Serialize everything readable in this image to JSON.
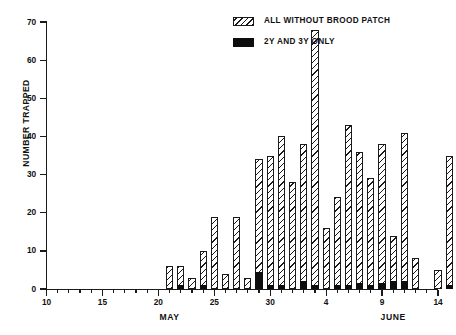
{
  "chart_data": {
    "type": "bar",
    "title": "",
    "subtitle": "",
    "xlabel": "",
    "ylabel": "NUMBER TRAPPED",
    "ylim": [
      0,
      70
    ],
    "ytick_values": [
      0,
      10,
      20,
      30,
      40,
      50,
      60,
      70
    ],
    "ytick_labels": [
      "0",
      "10",
      "20",
      "30",
      "40",
      "50",
      "60",
      "70"
    ],
    "xlim": [
      "May 10",
      "June 14"
    ],
    "xtick_labels": [
      "10",
      "15",
      "20",
      "25",
      "30",
      "4",
      "9",
      "14"
    ],
    "xtick_days": [
      0,
      5,
      10,
      15,
      20,
      25,
      30,
      35
    ],
    "month_labels": [
      "MAY",
      "JUNE"
    ],
    "grid": false,
    "legend_position": "top-right",
    "stacked": true,
    "series": [
      {
        "name": "ALL WITHOUT BROOD PATCH",
        "style": "hatched",
        "values": [
          0,
          6,
          6,
          3,
          10,
          19,
          4,
          19,
          3,
          34,
          35,
          40,
          28,
          38,
          68,
          16,
          24,
          43,
          36,
          29,
          38,
          14,
          41,
          8,
          5,
          35,
          27,
          23,
          2,
          30,
          4,
          2,
          0,
          13,
          15,
          0
        ]
      },
      {
        "name": "2Y AND 3Y ONLY",
        "style": "solid",
        "values": [
          0,
          0,
          1,
          0,
          1,
          0,
          0,
          0,
          0,
          4.5,
          1,
          1,
          0,
          2,
          1,
          0,
          1,
          1,
          1.5,
          1,
          1.5,
          2,
          2,
          0,
          0,
          1,
          1,
          1,
          0,
          1,
          0,
          0,
          0,
          0,
          0,
          0
        ]
      }
    ],
    "categories": [
      "10",
      "11",
      "12",
      "13",
      "14",
      "15",
      "16",
      "17",
      "18",
      "19",
      "20",
      "21",
      "22",
      "23",
      "24",
      "25",
      "26",
      "27",
      "28",
      "29",
      "30",
      "31",
      "1",
      "2",
      "3",
      "4",
      "5",
      "6",
      "7",
      "8",
      "9",
      "10",
      "11",
      "12",
      "13",
      "14"
    ],
    "bars": [
      {
        "day": 11,
        "total": 6,
        "black": 0
      },
      {
        "day": 12,
        "total": 6,
        "black": 1
      },
      {
        "day": 13,
        "total": 3,
        "black": 0
      },
      {
        "day": 14,
        "total": 10,
        "black": 1
      },
      {
        "day": 15,
        "total": 19,
        "black": 0
      },
      {
        "day": 16,
        "total": 4,
        "black": 0
      },
      {
        "day": 17,
        "total": 19,
        "black": 0
      },
      {
        "day": 18,
        "total": 3,
        "black": 0
      },
      {
        "day": 19,
        "total": 34,
        "black": 4.5
      },
      {
        "day": 20,
        "total": 35,
        "black": 1
      },
      {
        "day": 21,
        "total": 40,
        "black": 1
      },
      {
        "day": 22,
        "total": 28,
        "black": 0
      },
      {
        "day": 23,
        "total": 38,
        "black": 2
      },
      {
        "day": 24,
        "total": 68,
        "black": 1
      },
      {
        "day": 25,
        "total": 16,
        "black": 0
      },
      {
        "day": 26,
        "total": 24,
        "black": 1
      },
      {
        "day": 27,
        "total": 43,
        "black": 1
      },
      {
        "day": 28,
        "total": 36,
        "black": 1.5
      },
      {
        "day": 29,
        "total": 29,
        "black": 1
      },
      {
        "day": 30,
        "total": 38,
        "black": 1.5
      },
      {
        "day": 31,
        "total": 14,
        "black": 2
      },
      {
        "day": 32,
        "total": 41,
        "black": 2
      },
      {
        "day": 33,
        "total": 8,
        "black": 0
      },
      {
        "day": 35,
        "total": 5,
        "black": 0
      },
      {
        "day": 36,
        "total": 35,
        "black": 1
      },
      {
        "day": 37,
        "total": 27,
        "black": 1
      },
      {
        "day": 38,
        "total": 23,
        "black": 1
      },
      {
        "day": 39,
        "total": 2,
        "black": 0
      },
      {
        "day": 40,
        "total": 30,
        "black": 1
      },
      {
        "day": 41,
        "total": 4,
        "black": 0
      },
      {
        "day": 42,
        "total": 2,
        "black": 0
      },
      {
        "day": 45,
        "total": 13,
        "black": 0
      },
      {
        "day": 46,
        "total": 15,
        "black": 0
      }
    ]
  },
  "legend": {
    "items": [
      {
        "label": "ALL WITHOUT BROOD PATCH",
        "style": "hatched"
      },
      {
        "label": "2Y AND 3Y ONLY",
        "style": "solid"
      }
    ]
  },
  "axes": {
    "ylabel": "NUMBER TRAPPED",
    "ytick_labels": [
      "0",
      "10",
      "20",
      "30",
      "40",
      "50",
      "60",
      "70"
    ],
    "xtick_labels": [
      "10",
      "15",
      "20",
      "25",
      "30",
      "4",
      "9",
      "14"
    ],
    "months": [
      "MAY",
      "JUNE"
    ]
  }
}
